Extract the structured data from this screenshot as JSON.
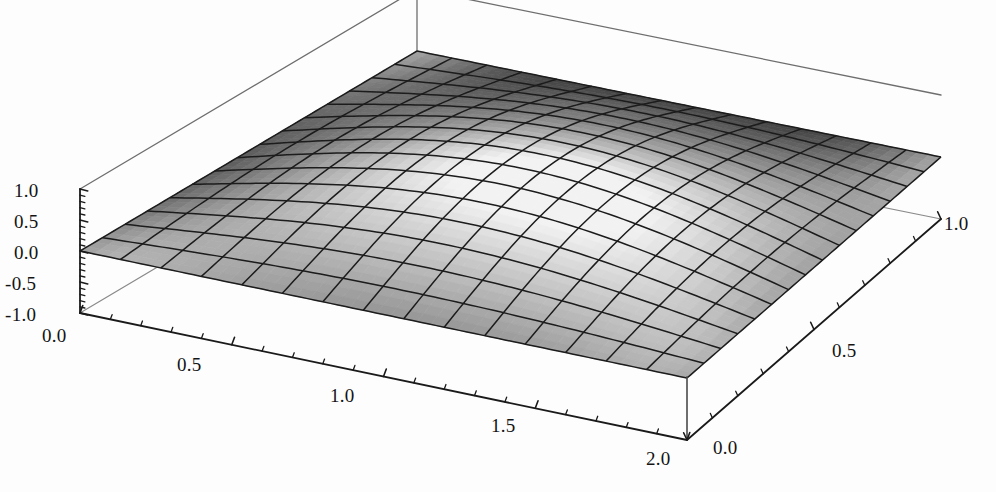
{
  "figure": {
    "kind": "3d-surface-plot",
    "background_color": "#fdfdfd",
    "axis_color": "#1a1a1a",
    "mesh_color": "#1c1c1c",
    "surface_light": "#f2f2f2",
    "surface_dark": "#555555",
    "ghost_header": ""
  },
  "axes": {
    "x": {
      "label": "",
      "ticks": [
        "0.0",
        "0.5",
        "1.0",
        "1.5",
        "2.0"
      ],
      "tick_values": [
        0.0,
        0.5,
        1.0,
        1.5,
        2.0
      ],
      "range": [
        0.0,
        2.0
      ],
      "minor_ticks_per_interval": 4
    },
    "y": {
      "label": "",
      "ticks": [
        "0.0",
        "0.5",
        "1.0"
      ],
      "tick_values": [
        0.0,
        0.5,
        1.0
      ],
      "range": [
        0.0,
        1.0
      ],
      "minor_ticks_per_interval": 4
    },
    "z": {
      "label": "",
      "ticks": [
        "1.0",
        "0.5",
        "0.0",
        "-0.5",
        "-1.0"
      ],
      "tick_values": [
        1.0,
        0.5,
        0.0,
        -0.5,
        -1.0
      ],
      "range": [
        -1.0,
        1.0
      ],
      "minor_ticks_per_interval": 4
    }
  },
  "chart_data": {
    "type": "surface",
    "title": "",
    "subtitle": "",
    "xlabel": "",
    "ylabel": "",
    "zlabel": "",
    "xlim": [
      0.0,
      2.0
    ],
    "ylim": [
      0.0,
      1.0
    ],
    "zlim": [
      -1.0,
      1.0
    ],
    "xticks": [
      0.0,
      0.5,
      1.0,
      1.5,
      2.0
    ],
    "yticks": [
      0.0,
      0.5,
      1.0
    ],
    "zticks": [
      -1.0,
      -0.5,
      0.0,
      0.5,
      1.0
    ],
    "grid": false,
    "legend": null,
    "colormap": "grayscale",
    "mesh_divisions_x": 15,
    "mesh_divisions_y": 15,
    "z_function": "0.78 * sin(pi*x/2) * sin(pi*y)",
    "x_samples": [
      0.0,
      0.1333,
      0.2667,
      0.4,
      0.5333,
      0.6667,
      0.8,
      0.9333,
      1.0667,
      1.2,
      1.3333,
      1.4667,
      1.6,
      1.7333,
      1.8667,
      2.0
    ],
    "y_samples": [
      0.0,
      0.0667,
      0.1333,
      0.2,
      0.2667,
      0.3333,
      0.4,
      0.4667,
      0.5333,
      0.6,
      0.6667,
      0.7333,
      0.8,
      0.8667,
      0.9333,
      1.0
    ],
    "z_min_observed": 0.0,
    "z_max_observed": 0.78
  },
  "labels": {
    "z": [
      {
        "text": "1.0",
        "x": 14,
        "y": 180
      },
      {
        "text": "0.5",
        "x": 14,
        "y": 211
      },
      {
        "text": "0.0",
        "x": 14,
        "y": 242
      },
      {
        "text": "-0.5",
        "x": 5,
        "y": 273
      },
      {
        "text": "-1.0",
        "x": 5,
        "y": 304
      }
    ],
    "x": [
      {
        "text": "0.0",
        "x": 42,
        "y": 325
      },
      {
        "text": "0.5",
        "x": 177,
        "y": 354
      },
      {
        "text": "1.0",
        "x": 330,
        "y": 385
      },
      {
        "text": "1.5",
        "x": 491,
        "y": 415
      },
      {
        "text": "2.0",
        "x": 646,
        "y": 448
      }
    ],
    "y": [
      {
        "text": "0.0",
        "x": 713,
        "y": 437
      },
      {
        "text": "0.5",
        "x": 832,
        "y": 340
      },
      {
        "text": "1.0",
        "x": 944,
        "y": 213
      }
    ]
  }
}
